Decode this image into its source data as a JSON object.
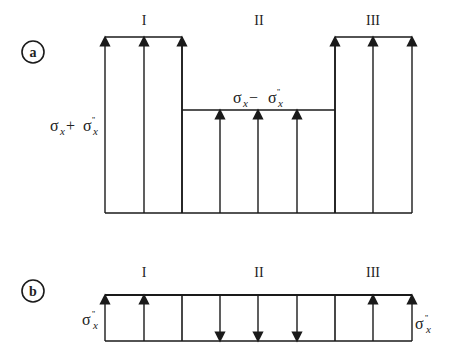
{
  "figure": {
    "panel_a": {
      "badge": "a",
      "zones": [
        "I",
        "II",
        "III"
      ],
      "label_left": {
        "sigma": "σ",
        "sub": "x",
        "op": " + ",
        "sigma2": "σ",
        "sup2": "''",
        "sub2": "x"
      },
      "label_middle": {
        "sigma": "σ",
        "sub": "x",
        "op": " − ",
        "sigma2": "σ",
        "sup2": "''",
        "sub2": "x"
      },
      "arrows_up_on_top": [
        105,
        144,
        182,
        220,
        258,
        297,
        335,
        373,
        412
      ]
    },
    "panel_b": {
      "badge": "b",
      "zones": [
        "I",
        "II",
        "III"
      ],
      "label_left": {
        "sigma": "σ",
        "sup": "''",
        "sub": "x"
      },
      "label_right": {
        "sigma": "σ",
        "sup": "''",
        "sub": "x"
      }
    },
    "colors": {
      "line": "#1a1a1a",
      "text": "#222222"
    }
  }
}
